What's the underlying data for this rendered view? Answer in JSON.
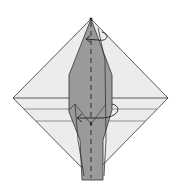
{
  "diagram": {
    "type": "origami-fold-step",
    "colors": {
      "paper_light": "#ececec",
      "paper_dark": "#9a9a9a",
      "line": "#333333",
      "background": "#ffffff"
    },
    "symbols": [
      {
        "name": "valley-fold-line",
        "orientation": "vertical"
      },
      {
        "name": "rotate-arrow-top"
      },
      {
        "name": "rotate-arrow-middle"
      }
    ]
  }
}
